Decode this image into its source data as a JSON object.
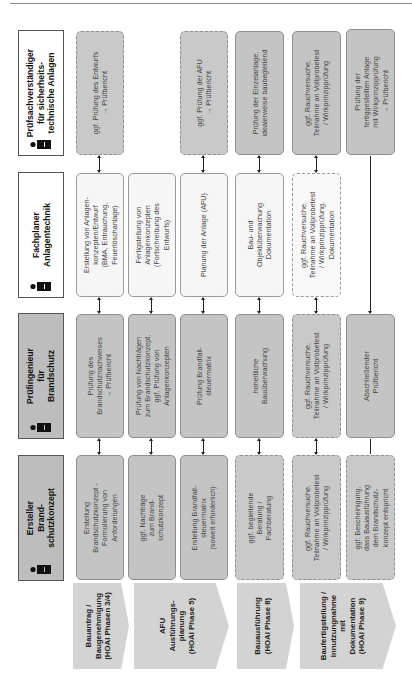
{
  "roles": [
    {
      "label": "Prüfsachverständiger\nfür sicherheits-\ntechnische Anlagen",
      "icon": "person-icon"
    },
    {
      "label": "Fachplaner\nAnlagentechnik",
      "icon": "person-icon"
    },
    {
      "label": "Prüfingenieur\nfür Brandschutz",
      "icon": "person-icon"
    },
    {
      "label": "Ersteller Brand-\nschutzkonzept",
      "icon": "person-icon"
    }
  ],
  "phases": [
    {
      "label": "Bauantrag /\nBaugenehmigung\n(HOAI Phasen 3/4)"
    },
    {
      "label": "AFU\nAusführungs-\nplanung\n(HOAI Phase 5)"
    },
    {
      "label": "Bauausführung\n(HOAI Phase 8)"
    },
    {
      "label": "Baufertigstellung /\nInnutzungnahme\nmit\nDokumentation\n(HOAI Phase 9)"
    }
  ],
  "grid": {
    "pruefsachverstaendiger": [
      "ggf. Prüfung des Entwurfs\n→ Prüfbericht",
      "",
      "ggf. Prüfung der AFU\n→ Prüfbericht",
      "Prüfung der Einzelanlage,\nidealerweise baubegleitend",
      "ggf. Rauchversuche,\nTeilnahme an Vollprobetest\n/ Wirkprinzipprüfung",
      "Prüfung der\nfertiggestellten Anlage\nmit Wirkprinzipprüfung\n→ Prüfbericht"
    ],
    "fachplaner": [
      "Erstellung von Anlagen-\nkonzepten/Entwurf\n(BMA, Entrauchung,\nFeuerlöschanlage)",
      "Fertigstellung von\nAnlagenkonzepten\n(Fortschreibung des\nEntwurfs)",
      "Planung der Anlage (AFU)",
      "Bau- und\nObjektüberwachung\nDokumentation",
      "ggf. Rauchversuche,\nTeilnahme an Vollprobetest\n/ Wirkprinzipprüfung,\nDokumentation",
      ""
    ],
    "pruefingenieur": [
      "Prüfung des\nBrandschutznachweises\n→ Prüfbericht",
      "Prüfung von Nachträgen\nzum Brandschutzkonzept,\nggf. Prüfung von\nAnlagenkonzepten",
      "Prüfung Brandfall-\nsteuermatrix",
      "hoheitliche\nBauüberwachung",
      "ggf. Rauchversuche,\nTeilnahme an Vollprobetest\n/ Wirkprinzipprüfung",
      "Abschließender\nPrüfbericht"
    ],
    "ersteller": [
      "Erstellung\nBrandschutzkonzept -\nFormulierung von\nAnforderungen",
      "ggf. Nachträge\nzum Brand-\nschutzkonzept",
      "Erstellung Brandfall-\nsteuermatrix\n(soweit erforderlich)",
      "ggf. begleitende\nBeratung /\nFachberatung",
      "ggf. Rauchversuche,\nTeilnahme an Vollprobetest\n/ Wirkprinzipprüfung",
      "ggf. Bescheinigung,\ndass Bauausführung\ndem Brandschutz-\nkonzept entspricht"
    ]
  },
  "colors": {
    "role_gray": "#bdbdbd",
    "cell_gray": "#c4c4c4",
    "cell_light": "#f6f6f6",
    "phase": "#d3d3d3"
  }
}
